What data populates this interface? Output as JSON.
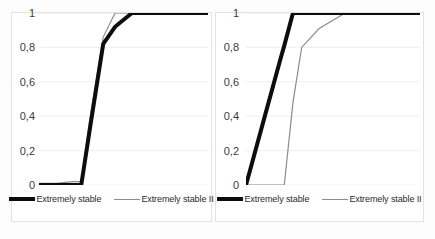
{
  "figure": {
    "background_color": "#fdfdfd",
    "panel_border_color": "#e3e3e3",
    "gridline_color": "#e8e8e8",
    "series_primary_color": "#0d0d0d",
    "series_secondary_color": "#8c8c8c"
  },
  "legend": {
    "primary_label": "Extremely stable",
    "secondary_label": "Extremely stable II"
  },
  "axis": {
    "tick_labels": [
      "1",
      "0,8",
      "0,6",
      "0,4",
      "0,2",
      "0"
    ],
    "tick_values": [
      1,
      0.8,
      0.6,
      0.4,
      0.2,
      0
    ]
  },
  "chart_data": [
    {
      "type": "line",
      "panel": "left",
      "title": "",
      "xlabel": "",
      "ylabel": "",
      "ylim": [
        0,
        1
      ],
      "xlim": [
        0,
        100
      ],
      "grid": true,
      "legend_position": "bottom",
      "x": [
        0,
        10,
        20,
        25,
        30,
        38,
        45,
        55,
        70,
        85,
        100
      ],
      "series": [
        {
          "name": "Extremely stable",
          "color": "#0d0d0d",
          "width": 4,
          "values": [
            0.0,
            0.0,
            0.0,
            0.0,
            0.32,
            0.82,
            0.92,
            1.0,
            1.0,
            1.0,
            1.0
          ]
        },
        {
          "name": "Extremely stable II",
          "color": "#8c8c8c",
          "width": 1.2,
          "values": [
            0.01,
            0.01,
            0.02,
            0.02,
            0.38,
            0.86,
            1.0,
            1.0,
            1.0,
            1.0,
            1.0
          ]
        }
      ]
    },
    {
      "type": "line",
      "panel": "right",
      "title": "",
      "xlabel": "",
      "ylabel": "",
      "ylim": [
        0,
        1
      ],
      "xlim": [
        0,
        100
      ],
      "grid": true,
      "legend_position": "bottom",
      "x": [
        0,
        10,
        20,
        22,
        27,
        32,
        42,
        57,
        70,
        85,
        100
      ],
      "series": [
        {
          "name": "Extremely stable",
          "color": "#0d0d0d",
          "width": 4,
          "values": [
            0.0,
            0.37,
            0.74,
            0.81,
            1.0,
            1.0,
            1.0,
            1.0,
            1.0,
            1.0,
            1.0
          ]
        },
        {
          "name": "Extremely stable II",
          "color": "#8c8c8c",
          "width": 1.2,
          "values": [
            0.0,
            0.0,
            0.0,
            0.0,
            0.48,
            0.8,
            0.91,
            1.0,
            1.0,
            1.0,
            1.0
          ]
        }
      ]
    }
  ]
}
